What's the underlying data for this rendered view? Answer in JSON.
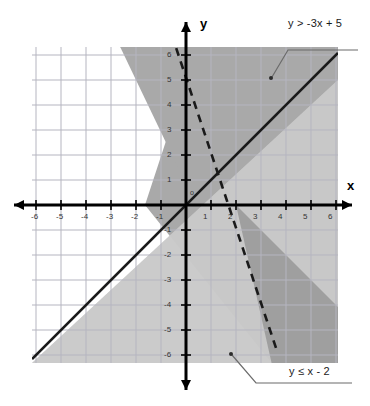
{
  "chart_data": {
    "type": "line",
    "title": "",
    "xlabel": "x",
    "ylabel": "y",
    "xlim": [
      -6.2,
      6.1
    ],
    "ylim": [
      -6.3,
      6.3
    ],
    "grid": true,
    "origin_label": "o",
    "x_ticks": [
      "-6",
      "-5",
      "-4",
      "-3",
      "-2",
      "-1",
      "1",
      "2",
      "3",
      "4",
      "5",
      "6"
    ],
    "y_ticks": [
      "6",
      "5",
      "4",
      "3",
      "2",
      "1",
      "-1",
      "-2",
      "-3",
      "-4",
      "-5",
      "-6"
    ],
    "series": [
      {
        "name": "y > -3x + 5",
        "label": "y > -3x + 5",
        "equation": "y = -3x + 5",
        "slope": -3,
        "intercept": 5,
        "line_style": "dashed",
        "shade": "above",
        "shade_color": "#a8a8a8",
        "x_intercept": 1.6667,
        "y_intercept": 5
      },
      {
        "name": "y <= x - 2",
        "label": "y ≤ x - 2",
        "equation": "y = x - 2",
        "slope": 1,
        "intercept": -2,
        "line_style": "solid",
        "shade": "below",
        "shade_color": "#c9c9c9",
        "x_intercept": 2,
        "y_intercept": -2
      }
    ],
    "intersection_point": [
      2,
      0
    ],
    "overlap_color": "#8f8f8f",
    "line_color": "#1a1a1a",
    "grid_color": "#b9b9c4",
    "axis_color": "#000000",
    "background_color": "#ffffff",
    "annotations": [
      {
        "text": "y > -3x + 5",
        "leader_from": [
          3.45,
          5.75
        ],
        "leader_to": [
          5.0,
          6.9
        ]
      },
      {
        "text": "y ≤ x - 2",
        "leader_from": [
          0.35,
          -5.9
        ],
        "leader_to": [
          2.3,
          -7.0
        ]
      }
    ]
  },
  "labels": {
    "x_axis": "x",
    "y_axis": "y",
    "origin": "o",
    "upper_inequality": "y > -3x + 5",
    "lower_inequality": "y ≤ x - 2"
  },
  "x_ticks": [
    {
      "text": "-6",
      "x": 36,
      "y": 212
    },
    {
      "text": "-5",
      "x": 61,
      "y": 212
    },
    {
      "text": "-4",
      "x": 86,
      "y": 212
    },
    {
      "text": "-3",
      "x": 111,
      "y": 212
    },
    {
      "text": "-2",
      "x": 136,
      "y": 212
    },
    {
      "text": "-1",
      "x": 161,
      "y": 212
    },
    {
      "text": "1",
      "x": 208,
      "y": 212
    },
    {
      "text": "2",
      "x": 233,
      "y": 212
    },
    {
      "text": "3",
      "x": 258,
      "y": 212
    },
    {
      "text": "4",
      "x": 283,
      "y": 212
    },
    {
      "text": "5",
      "x": 308,
      "y": 212
    },
    {
      "text": "6",
      "x": 333,
      "y": 212
    }
  ],
  "y_ticks": [
    {
      "text": "6",
      "x": 173,
      "y": 55
    },
    {
      "text": "5",
      "x": 173,
      "y": 80
    },
    {
      "text": "4",
      "x": 173,
      "y": 105
    },
    {
      "text": "3",
      "x": 173,
      "y": 130
    },
    {
      "text": "2",
      "x": 173,
      "y": 155
    },
    {
      "text": "1",
      "x": 173,
      "y": 180
    },
    {
      "text": "-1",
      "x": 170,
      "y": 230
    },
    {
      "text": "-2",
      "x": 170,
      "y": 255
    },
    {
      "text": "-3",
      "x": 170,
      "y": 280
    },
    {
      "text": "-4",
      "x": 170,
      "y": 305
    },
    {
      "text": "-5",
      "x": 170,
      "y": 330
    },
    {
      "text": "-6",
      "x": 170,
      "y": 355
    }
  ]
}
